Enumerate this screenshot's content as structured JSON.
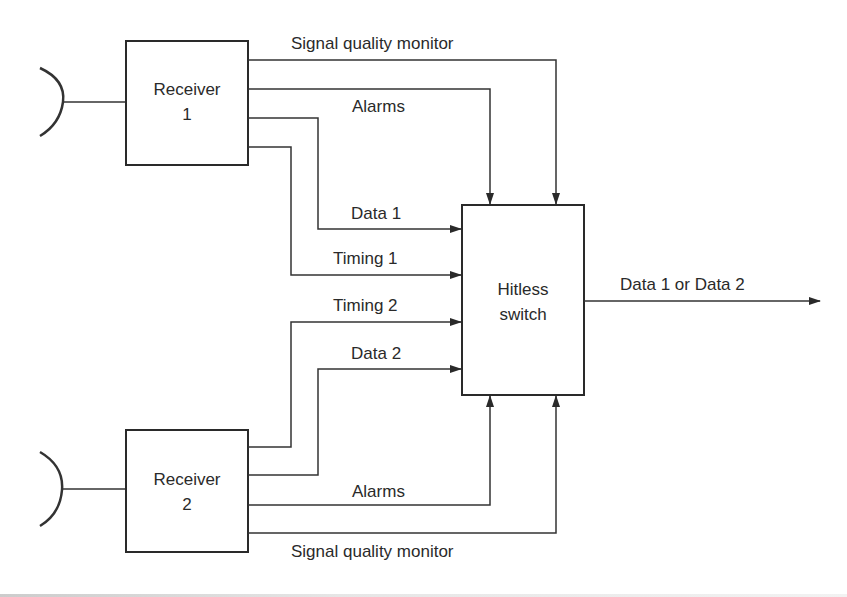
{
  "diagram": {
    "blocks": {
      "receiver1": {
        "line1": "Receiver",
        "line2": "1"
      },
      "receiver2": {
        "line1": "Receiver",
        "line2": "2"
      },
      "hitless_switch": {
        "line1": "Hitless",
        "line2": "switch"
      }
    },
    "signals": {
      "sqm1": "Signal quality monitor",
      "alarms1": "Alarms",
      "data1": "Data 1",
      "timing1": "Timing 1",
      "timing2": "Timing 2",
      "data2": "Data 2",
      "alarms2": "Alarms",
      "sqm2": "Signal quality monitor",
      "output": "Data 1 or Data 2"
    }
  }
}
